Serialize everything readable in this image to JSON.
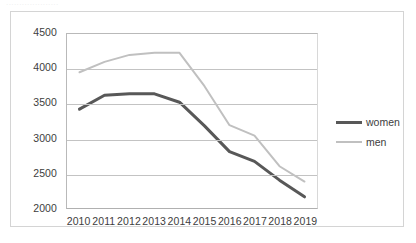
{
  "page": {
    "top_strip_text": "····················"
  },
  "colors": {
    "women_line": "#585858",
    "men_line": "#c0c0c0",
    "gridline": "#c3c3c3",
    "axis": "#b0b0b0",
    "outer_border": "#d4d4d4",
    "text": "#3d3d3d",
    "background": "#ffffff"
  },
  "chart_data": {
    "type": "line",
    "title": "",
    "xlabel": "",
    "ylabel": "",
    "categories": [
      "2010",
      "2011",
      "2012",
      "2013",
      "2014",
      "2015",
      "2016",
      "2017",
      "2018",
      "2019"
    ],
    "ylim": [
      2000,
      4500
    ],
    "yticks": [
      "2000",
      "2500",
      "3000",
      "3500",
      "4000",
      "4500"
    ],
    "ytick_values": [
      2000,
      2500,
      3000,
      3500,
      4000,
      4500
    ],
    "grid": true,
    "legend_position": "right",
    "series": [
      {
        "name": "women",
        "color": "#585858",
        "width": 3,
        "values": [
          3420,
          3620,
          3640,
          3640,
          3520,
          3180,
          2810,
          2670,
          2400,
          2160
        ]
      },
      {
        "name": "men",
        "color": "#c0c0c0",
        "width": 2,
        "values": [
          3950,
          4100,
          4200,
          4230,
          4230,
          3750,
          3190,
          3040,
          2600,
          2380
        ]
      }
    ]
  }
}
